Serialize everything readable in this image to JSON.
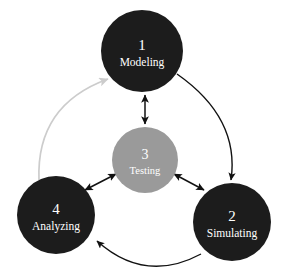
{
  "diagram": {
    "background_color": "#ffffff",
    "nodes": [
      {
        "id": "modeling",
        "number": "1",
        "label": "Modeling",
        "color": "#1c1c1c",
        "text_color": "#ffffff",
        "cx": 142,
        "cy": 51,
        "r": 41,
        "num_font_size": 15,
        "label_font_size": 11.5
      },
      {
        "id": "simulating",
        "number": "2",
        "label": "Simulating",
        "color": "#1c1c1c",
        "text_color": "#ffffff",
        "cx": 232,
        "cy": 222,
        "r": 39,
        "num_font_size": 15,
        "label_font_size": 11.5
      },
      {
        "id": "testing",
        "number": "3",
        "label": "Testing",
        "color": "#9a9a9a",
        "text_color": "#ffffff",
        "cx": 145,
        "cy": 160,
        "r": 33,
        "num_font_size": 14,
        "label_font_size": 10.5
      },
      {
        "id": "analyzing",
        "number": "4",
        "label": "Analyzing",
        "color": "#1c1c1c",
        "text_color": "#ffffff",
        "cx": 56,
        "cy": 215,
        "r": 39,
        "num_font_size": 15,
        "label_font_size": 11.5
      }
    ],
    "connectors": [
      {
        "id": "modeling-testing",
        "from": "modeling",
        "to": "testing",
        "style": "straight",
        "heads": "double",
        "color": "#111111",
        "path": "M 145 95 L 145 124"
      },
      {
        "id": "analyzing-testing",
        "from": "analyzing",
        "to": "testing",
        "style": "straight",
        "heads": "double",
        "color": "#111111",
        "path": "M 85 190 L 116 174"
      },
      {
        "id": "testing-simulating",
        "from": "testing",
        "to": "simulating",
        "style": "straight",
        "heads": "double",
        "color": "#111111",
        "path": "M 174 174 L 204 190"
      },
      {
        "id": "modeling-to-simulating",
        "from": "modeling",
        "to": "simulating",
        "style": "curved",
        "heads": "single",
        "color": "#111111",
        "path": "M 177 74 Q 240 118 231 180"
      },
      {
        "id": "simulating-to-analyzing",
        "from": "simulating",
        "to": "analyzing",
        "style": "curved",
        "heads": "single",
        "color": "#111111",
        "path": "M 201 254 Q 145 284 97 241"
      },
      {
        "id": "analyzing-to-modeling",
        "from": "analyzing",
        "to": "modeling",
        "style": "curved",
        "heads": "single",
        "color": "#cccccc",
        "path": "M 39 180 Q 36 105 108 79"
      }
    ]
  }
}
